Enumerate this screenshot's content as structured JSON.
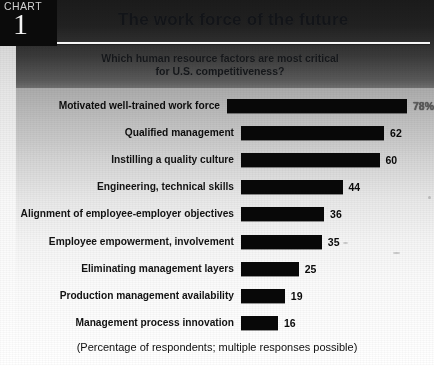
{
  "badge": {
    "kicker": "CHART",
    "number": "1"
  },
  "header": {
    "title": "The work force of the future",
    "subtitle_line1": "Which human resource factors are most critical",
    "subtitle_line2": "for U.S. competitiveness?"
  },
  "footnote": "(Percentage of respondents; multiple responses possible)",
  "colors": {
    "bar": "#0a0a0a",
    "badge_background": "#0d0d0d",
    "badge_text": "#f2f2f2",
    "rule": "#f3f3f3",
    "ink": "#101010"
  },
  "chart_data": {
    "type": "bar",
    "orientation": "horizontal",
    "title": "The work force of the future",
    "subtitle": "Which human resource factors are most critical for U.S. competitiveness?",
    "xlabel": "",
    "ylabel": "",
    "xlim": [
      0,
      78
    ],
    "grid": false,
    "legend": null,
    "note": "(Percentage of respondents; multiple responses possible)",
    "categories": [
      "Motivated well-trained work force",
      "Qualified management",
      "Instilling a quality culture",
      "Engineering, technical skills",
      "Alignment of employee-employer objectives",
      "Employee empowerment, involvement",
      "Eliminating management layers",
      "Production management availability",
      "Management process innovation"
    ],
    "values": [
      78,
      62,
      60,
      44,
      36,
      35,
      25,
      19,
      16
    ],
    "value_labels": [
      "78%",
      "62",
      "60",
      "44",
      "36",
      "35",
      "25",
      "19",
      "16"
    ]
  }
}
